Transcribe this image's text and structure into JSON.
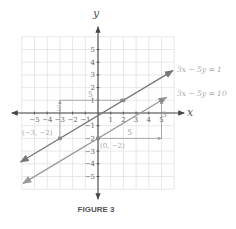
{
  "chart_data": {
    "type": "line",
    "title": "",
    "caption": "FIGURE 3",
    "xlabel": "x",
    "ylabel": "y",
    "xlim": [
      -6,
      6
    ],
    "ylim": [
      -6,
      6
    ],
    "grid": true,
    "x_ticks": [
      -5,
      -4,
      -3,
      -2,
      -1,
      1,
      2,
      3,
      4,
      5
    ],
    "y_ticks": [
      5,
      4,
      3,
      2,
      1,
      -1,
      -2,
      -3,
      -4,
      -5
    ],
    "x_tick_labels": [
      "−5",
      "−4",
      "−3",
      "−2",
      "−1",
      "1",
      "2",
      "3",
      "4",
      "5"
    ],
    "y_tick_labels": [
      "5",
      "4",
      "3",
      "2",
      "1",
      "−1",
      "−2",
      "−3",
      "−4",
      "−5"
    ],
    "series": [
      {
        "name": "3x − 5y = 1",
        "label": "3x − 5y = 1",
        "slope": 0.6,
        "intercept": -0.2,
        "x_range": [
          -6.1,
          5.9
        ],
        "color": "#777777",
        "points": [
          {
            "x": -3,
            "y": -2,
            "label": "(−3, −2)"
          },
          {
            "x": 2,
            "y": 1,
            "label": ""
          }
        ],
        "slope_triangle": {
          "from": [
            -3,
            -2
          ],
          "corner": [
            -3,
            1
          ],
          "to": [
            2,
            1
          ],
          "rise_label": "3",
          "run_label": "5"
        }
      },
      {
        "name": "3x − 5y = 10",
        "label": "3x − 5y = 10",
        "slope": 0.6,
        "intercept": -2,
        "x_range": [
          -5.9,
          5.4
        ],
        "color": "#999999",
        "points": [
          {
            "x": 0,
            "y": -2,
            "label": "(0, −2)"
          },
          {
            "x": 5,
            "y": 1,
            "label": ""
          }
        ],
        "slope_triangle": {
          "from": [
            0,
            -2
          ],
          "corner": [
            5,
            -2
          ],
          "to": [
            5,
            1
          ],
          "rise_label": "3",
          "run_label": "5"
        }
      }
    ]
  }
}
